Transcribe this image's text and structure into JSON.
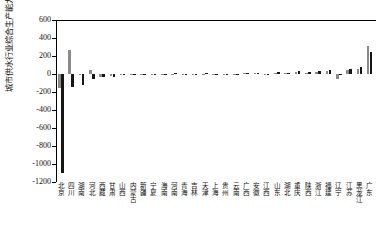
{
  "chart_data": {
    "type": "bar",
    "title": "",
    "xlabel": "",
    "ylabel": "城市供水行业综合生产能力(万立方米/日)",
    "ylim": [
      -1200,
      600
    ],
    "yticks": [
      600,
      400,
      200,
      0,
      -200,
      -400,
      -600,
      -800,
      -1000,
      -1200
    ],
    "ytick_labels": [
      "600",
      "400",
      "200",
      "0",
      "-200",
      "-400",
      "-600",
      "-800",
      "-1000",
      "-1200"
    ],
    "grid": false,
    "legend": "none",
    "colors": {
      "series0": "#8a8a8a",
      "series1": "#161616"
    },
    "categories": [
      "北京",
      "四川",
      "湖南",
      "河北",
      "西藏",
      "甘肃",
      "山西",
      "内蒙古",
      "新疆",
      "宁夏",
      "海南",
      "河南",
      "青海",
      "吉林",
      "天津",
      "上海",
      "贵州",
      "云南",
      "广西",
      "安徽",
      "江西",
      "山东",
      "湖北",
      "重庆",
      "陕西",
      "浙江",
      "福建",
      "辽宁",
      "江苏",
      "黑龙江",
      "广东"
    ],
    "series": [
      {
        "name": "系列1",
        "values": [
          -150,
          270,
          -8,
          45,
          -30,
          -25,
          -12,
          -6,
          -4,
          -3,
          -2,
          4,
          -3,
          -2,
          5,
          -4,
          3,
          -2,
          6,
          8,
          -5,
          12,
          10,
          18,
          14,
          22,
          30,
          -60,
          40,
          55,
          310
        ]
      },
      {
        "name": "系列2",
        "values": [
          -1100,
          -140,
          -120,
          -55,
          -35,
          -28,
          -10,
          -8,
          -5,
          -4,
          -3,
          6,
          -4,
          -3,
          8,
          -5,
          5,
          -3,
          10,
          14,
          -6,
          20,
          16,
          28,
          24,
          35,
          45,
          -10,
          60,
          75,
          250
        ]
      }
    ]
  }
}
